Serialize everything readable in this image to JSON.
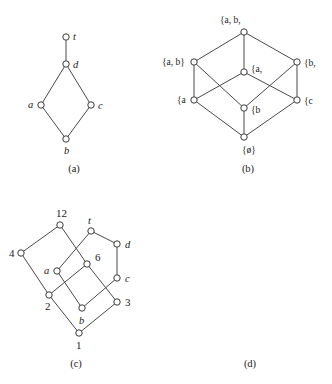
{
  "figure": {
    "panels": [
      {
        "caption": "(a)",
        "kind": "hasse-diagram",
        "nodes": [
          {
            "id": "t",
            "label": "t",
            "x": 66,
            "y": 37,
            "label_dx": 7,
            "label_dy": 3,
            "label_class": "node-label"
          },
          {
            "id": "d",
            "label": "d",
            "x": 66,
            "y": 64,
            "label_dx": 7,
            "label_dy": 4,
            "label_class": "node-label"
          },
          {
            "id": "a",
            "label": "a",
            "x": 41,
            "y": 105,
            "label_dx": -13,
            "label_dy": 3,
            "label_class": "node-label"
          },
          {
            "id": "c",
            "label": "c",
            "x": 91,
            "y": 105,
            "label_dx": 7,
            "label_dy": 4,
            "label_class": "node-label"
          },
          {
            "id": "b",
            "label": "b",
            "x": 66,
            "y": 139,
            "label_dx": -2,
            "label_dy": 15,
            "label_class": "node-label"
          }
        ],
        "edges": [
          [
            "t",
            "d"
          ],
          [
            "d",
            "a"
          ],
          [
            "d",
            "c"
          ],
          [
            "a",
            "b"
          ],
          [
            "c",
            "b"
          ]
        ]
      },
      {
        "caption": "(b)",
        "kind": "powerset-lattice",
        "nodes": [
          {
            "id": "abc",
            "label": "{a, b,",
            "x": 78,
            "y": 32,
            "label_dx": -24,
            "label_dy": -9,
            "label_class": "set-label"
          },
          {
            "id": "ab",
            "label": "{a, b}",
            "x": 28,
            "y": 62,
            "label_dx": -32,
            "label_dy": 3,
            "label_class": "set-label"
          },
          {
            "id": "ac",
            "label": "{a,",
            "x": 78,
            "y": 72,
            "label_dx": 7,
            "label_dy": 0,
            "label_class": "set-label"
          },
          {
            "id": "bc",
            "label": "{b,",
            "x": 131,
            "y": 62,
            "label_dx": 7,
            "label_dy": 4,
            "label_class": "set-label"
          },
          {
            "id": "a",
            "label": "{a",
            "x": 28,
            "y": 100,
            "label_dx": -17,
            "label_dy": 3,
            "label_class": "set-label"
          },
          {
            "id": "b",
            "label": "{b",
            "x": 78,
            "y": 108,
            "label_dx": 7,
            "label_dy": 5,
            "label_class": "set-label"
          },
          {
            "id": "c",
            "label": "{c",
            "x": 131,
            "y": 100,
            "label_dx": 7,
            "label_dy": 4,
            "label_class": "set-label"
          },
          {
            "id": "empty",
            "label": "{ø}",
            "x": 78,
            "y": 137,
            "label_dx": -2,
            "label_dy": 16,
            "label_class": "set-label"
          }
        ],
        "edges": [
          [
            "abc",
            "ab"
          ],
          [
            "abc",
            "ac"
          ],
          [
            "abc",
            "bc"
          ],
          [
            "ab",
            "a"
          ],
          [
            "ab",
            "b"
          ],
          [
            "ac",
            "a"
          ],
          [
            "ac",
            "c"
          ],
          [
            "bc",
            "b"
          ],
          [
            "bc",
            "c"
          ],
          [
            "a",
            "empty"
          ],
          [
            "b",
            "empty"
          ],
          [
            "c",
            "empty"
          ]
        ]
      },
      {
        "caption": "(c)",
        "kind": "divisibility-lattice",
        "nodes": [
          {
            "id": "12",
            "label": "12",
            "x": 60,
            "y": 225,
            "label_dx": -4,
            "label_dy": -8,
            "label_class": "num-label"
          },
          {
            "id": "4",
            "label": "4",
            "x": 21,
            "y": 253,
            "label_dx": -12,
            "label_dy": 4,
            "label_class": "num-label"
          },
          {
            "id": "6",
            "label": "6",
            "x": 87,
            "y": 264,
            "label_dx": 8,
            "label_dy": -3,
            "label_class": "num-label"
          },
          {
            "id": "2",
            "label": "2",
            "x": 49,
            "y": 295,
            "label_dx": -4,
            "label_dy": 15,
            "label_class": "num-label"
          },
          {
            "id": "3",
            "label": "3",
            "x": 117,
            "y": 302,
            "label_dx": 8,
            "label_dy": 4,
            "label_class": "num-label"
          },
          {
            "id": "1",
            "label": "1",
            "x": 79,
            "y": 333,
            "label_dx": -3,
            "label_dy": 16,
            "label_class": "num-label"
          }
        ],
        "edges": [
          [
            "12",
            "4"
          ],
          [
            "12",
            "6"
          ],
          [
            "4",
            "2"
          ],
          [
            "6",
            "2"
          ],
          [
            "6",
            "3"
          ],
          [
            "2",
            "1"
          ],
          [
            "3",
            "1"
          ]
        ]
      },
      {
        "caption": "(d)",
        "kind": "hasse-diagram",
        "nodes": [
          {
            "id": "t",
            "label": "t",
            "x": 91,
            "y": 231,
            "label_dx": -3,
            "label_dy": -7,
            "label_class": "node-label"
          },
          {
            "id": "d",
            "label": "d",
            "x": 117,
            "y": 244,
            "label_dx": 8,
            "label_dy": 4,
            "label_class": "node-label"
          },
          {
            "id": "a",
            "label": "a",
            "x": 57,
            "y": 271,
            "label_dx": -13,
            "label_dy": 3,
            "label_class": "node-label"
          },
          {
            "id": "c",
            "label": "c",
            "x": 117,
            "y": 278,
            "label_dx": 8,
            "label_dy": 4,
            "label_class": "node-label"
          },
          {
            "id": "b",
            "label": "b",
            "x": 82,
            "y": 308,
            "label_dx": -3,
            "label_dy": 16,
            "label_class": "node-label"
          }
        ],
        "edges": [
          [
            "t",
            "d"
          ],
          [
            "t",
            "a"
          ],
          [
            "d",
            "c"
          ],
          [
            "a",
            "b"
          ],
          [
            "c",
            "b"
          ]
        ]
      }
    ]
  },
  "style": {
    "node_radius": 3.2
  }
}
